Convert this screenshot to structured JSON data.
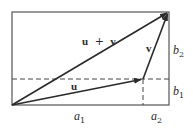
{
  "diagram": {
    "type": "vector-addition",
    "vectors": {
      "u": {
        "label": "u"
      },
      "v": {
        "label": "v"
      },
      "sum": {
        "label_left": "u",
        "label_op": "+",
        "label_right": "v"
      }
    },
    "components": {
      "a1": {
        "base": "a",
        "sub": "1"
      },
      "a2": {
        "base": "a",
        "sub": "2"
      },
      "b1": {
        "base": "b",
        "sub": "1"
      },
      "b2": {
        "base": "b",
        "sub": "2"
      }
    },
    "colors": {
      "line": "#2a2a2a",
      "box": "#555555",
      "dash": "#444444"
    }
  }
}
